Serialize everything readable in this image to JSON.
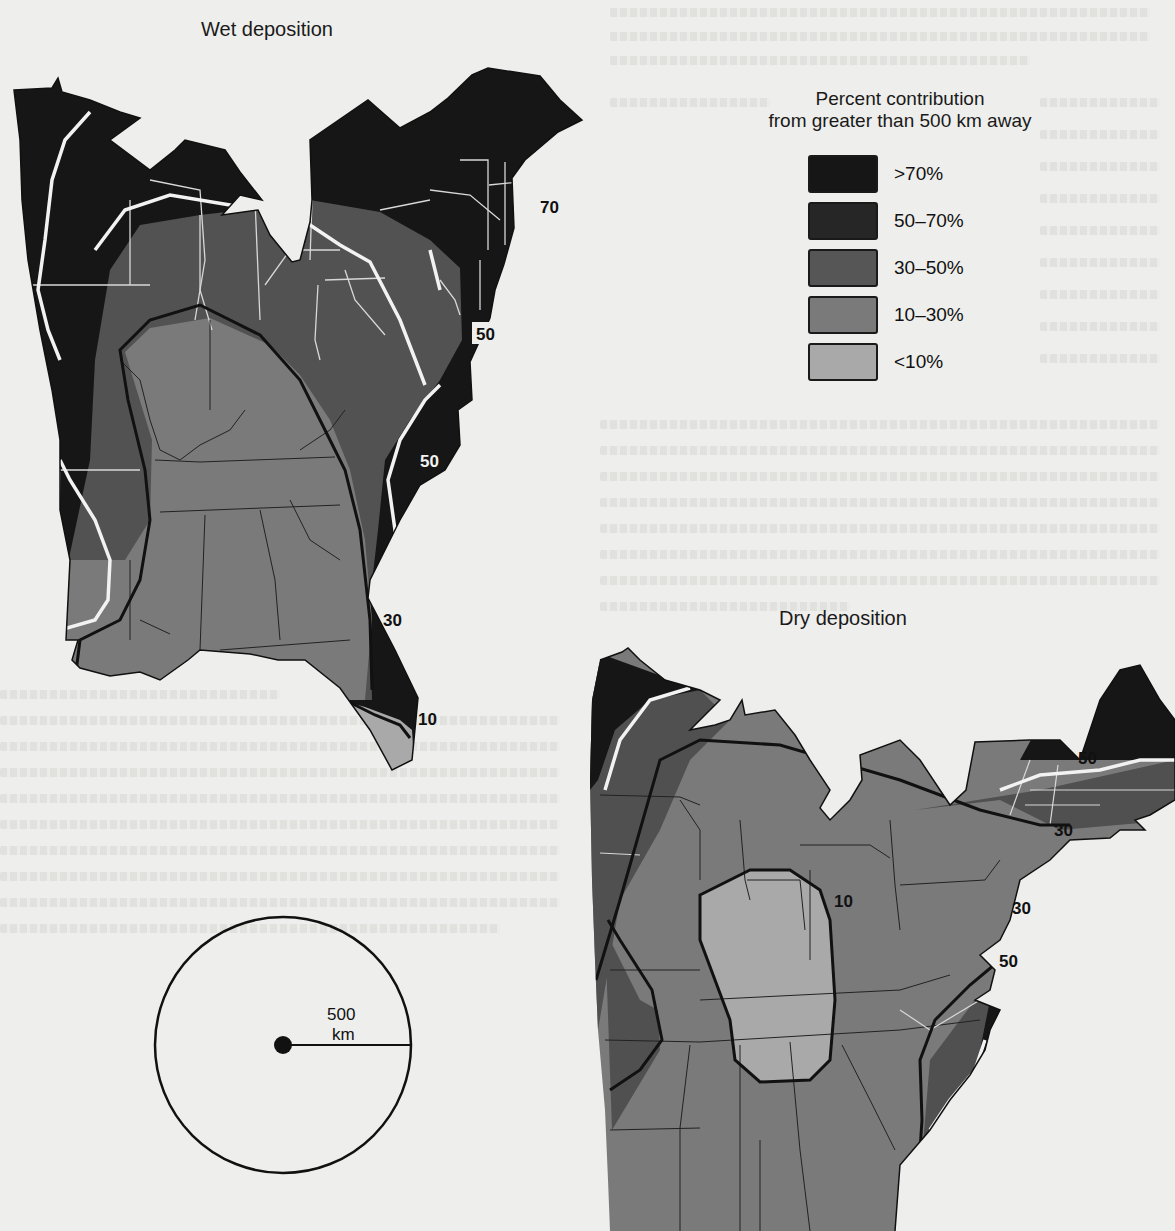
{
  "page": {
    "type": "scanned-figure",
    "background_color": "#eeeeec"
  },
  "legend": {
    "title_line1": "Percent contribution",
    "title_line2": "from greater than 500 km away",
    "classes": [
      {
        "label": ">70%",
        "color": "#161616"
      },
      {
        "label": "50–70%",
        "color": "#262626"
      },
      {
        "label": "30–50%",
        "color": "#565656"
      },
      {
        "label": "10–30%",
        "color": "#7a7a7a"
      },
      {
        "label": "<10%",
        "color": "#a9a9a9"
      }
    ]
  },
  "maps": [
    {
      "id": "wet",
      "title": "Wet deposition",
      "contour_labels": [
        "70",
        "50",
        "50",
        "30",
        "10"
      ]
    },
    {
      "id": "dry",
      "title": "Dry deposition",
      "contour_labels": [
        "50",
        "30",
        "30",
        "50",
        "10"
      ]
    }
  ],
  "scale": {
    "value": "500",
    "unit": "km"
  },
  "colors": {
    "very_dark": "#161616",
    "dark": "#262626",
    "mid": "#565656",
    "light": "#7a7a7a",
    "lightest": "#a9a9a9",
    "contour_white": "#f2f2f2",
    "contour_black": "#111111"
  }
}
